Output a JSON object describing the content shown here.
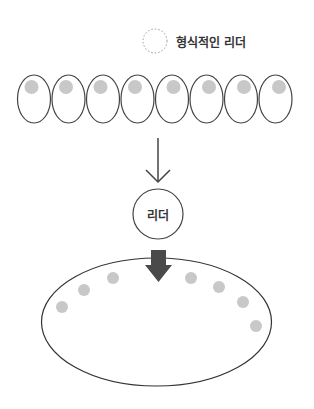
{
  "legend": {
    "label": "형식적인 리더",
    "icon": "dotted-circle-icon"
  },
  "top_group": {
    "member_count": 8,
    "member_shape": "egg-with-dot",
    "dot_color": "#c8c8c8",
    "outline_color": "#444444"
  },
  "arrow_thin": {
    "direction": "down",
    "color": "#444444"
  },
  "leader": {
    "label": "리더"
  },
  "arrow_thick": {
    "direction": "down",
    "color": "#4a4a4a"
  },
  "bottom_group": {
    "member_count": 7,
    "dot_color": "#c8c8c8",
    "outline_color": "#333333"
  }
}
